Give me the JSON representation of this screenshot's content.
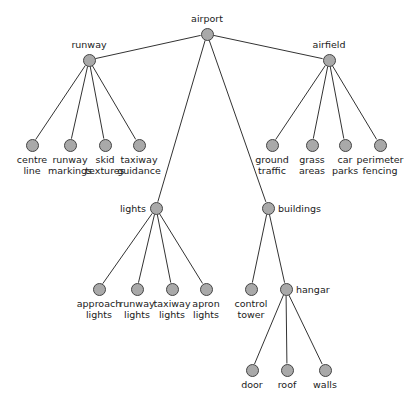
{
  "diagram": {
    "type": "tree",
    "canvas": {
      "width": 419,
      "height": 402
    },
    "style": {
      "node_fill": "#a9a9a9",
      "node_stroke": "#444444",
      "edge_color": "#333333",
      "label_color": "#1a1a1a",
      "background": "#ffffff",
      "node_radius": 6.5
    },
    "nodes": [
      {
        "id": "airport",
        "label": "airport",
        "x": 207,
        "y": 34,
        "label_pos": "above"
      },
      {
        "id": "runway",
        "label": "runway",
        "x": 89,
        "y": 60,
        "label_pos": "above"
      },
      {
        "id": "airfield",
        "label": "airfield",
        "x": 329,
        "y": 60,
        "label_pos": "above"
      },
      {
        "id": "centre_line",
        "label": "centre\nline",
        "x": 32,
        "y": 145,
        "label_pos": "below"
      },
      {
        "id": "runway_markings",
        "label": "runway\nmarkings",
        "x": 70,
        "y": 145,
        "label_pos": "below"
      },
      {
        "id": "skid_textures",
        "label": "skid\ntextures",
        "x": 105,
        "y": 145,
        "label_pos": "below"
      },
      {
        "id": "taxiway_guidance",
        "label": "taxiway\nguidance",
        "x": 139,
        "y": 145,
        "label_pos": "below"
      },
      {
        "id": "ground_traffic",
        "label": "ground\ntraffic",
        "x": 272,
        "y": 145,
        "label_pos": "below"
      },
      {
        "id": "grass_areas",
        "label": "grass\nareas",
        "x": 312,
        "y": 145,
        "label_pos": "below"
      },
      {
        "id": "car_parks",
        "label": "car\nparks",
        "x": 345,
        "y": 145,
        "label_pos": "below"
      },
      {
        "id": "perimeter_fencing",
        "label": "perimeter\nfencing",
        "x": 380,
        "y": 145,
        "label_pos": "below"
      },
      {
        "id": "lights",
        "label": "lights",
        "x": 156,
        "y": 208,
        "label_pos": "left"
      },
      {
        "id": "buildings",
        "label": "buildings",
        "x": 268,
        "y": 208,
        "label_pos": "right"
      },
      {
        "id": "approach_lights",
        "label": "approach\nlights",
        "x": 99,
        "y": 289,
        "label_pos": "below"
      },
      {
        "id": "runway_lights",
        "label": "runway\nlights",
        "x": 137,
        "y": 289,
        "label_pos": "below"
      },
      {
        "id": "taxiway_lights",
        "label": "taxiway\nlights",
        "x": 172,
        "y": 289,
        "label_pos": "below"
      },
      {
        "id": "apron_lights",
        "label": "apron\nlights",
        "x": 206,
        "y": 289,
        "label_pos": "below"
      },
      {
        "id": "control_tower",
        "label": "control\ntower",
        "x": 251,
        "y": 289,
        "label_pos": "below"
      },
      {
        "id": "hangar",
        "label": "hangar",
        "x": 286,
        "y": 289,
        "label_pos": "right"
      },
      {
        "id": "door",
        "label": "door",
        "x": 252,
        "y": 370,
        "label_pos": "below"
      },
      {
        "id": "roof",
        "label": "roof",
        "x": 287,
        "y": 370,
        "label_pos": "below"
      },
      {
        "id": "walls",
        "label": "walls",
        "x": 325,
        "y": 370,
        "label_pos": "below"
      }
    ],
    "edges": [
      {
        "from": "airport",
        "to": "runway"
      },
      {
        "from": "airport",
        "to": "airfield"
      },
      {
        "from": "airport",
        "to": "lights"
      },
      {
        "from": "airport",
        "to": "buildings"
      },
      {
        "from": "runway",
        "to": "centre_line"
      },
      {
        "from": "runway",
        "to": "runway_markings"
      },
      {
        "from": "runway",
        "to": "skid_textures"
      },
      {
        "from": "runway",
        "to": "taxiway_guidance"
      },
      {
        "from": "airfield",
        "to": "ground_traffic"
      },
      {
        "from": "airfield",
        "to": "grass_areas"
      },
      {
        "from": "airfield",
        "to": "car_parks"
      },
      {
        "from": "airfield",
        "to": "perimeter_fencing"
      },
      {
        "from": "lights",
        "to": "approach_lights"
      },
      {
        "from": "lights",
        "to": "runway_lights"
      },
      {
        "from": "lights",
        "to": "taxiway_lights"
      },
      {
        "from": "lights",
        "to": "apron_lights"
      },
      {
        "from": "buildings",
        "to": "control_tower"
      },
      {
        "from": "buildings",
        "to": "hangar"
      },
      {
        "from": "hangar",
        "to": "door"
      },
      {
        "from": "hangar",
        "to": "roof"
      },
      {
        "from": "hangar",
        "to": "walls"
      }
    ]
  }
}
